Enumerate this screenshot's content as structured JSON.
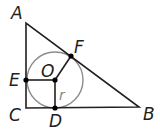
{
  "diagram": {
    "colors": {
      "line": "#231f20",
      "circle": "#8c8c8c",
      "point": "#000000",
      "radius_label": "#888888"
    },
    "points": {
      "A": {
        "label": "A",
        "x": 26,
        "y": 23
      },
      "B": {
        "label": "B",
        "x": 139,
        "y": 107
      },
      "C": {
        "label": "C",
        "x": 26,
        "y": 108
      },
      "D": {
        "label": "D",
        "x": 55,
        "y": 108
      },
      "E": {
        "label": "E",
        "x": 26,
        "y": 80
      },
      "F": {
        "label": "F",
        "x": 71,
        "y": 56
      },
      "O": {
        "label": "O",
        "x": 55,
        "y": 80
      }
    },
    "circle": {
      "center": "O",
      "radius": 28
    },
    "radius_label": "r",
    "segments": [
      "AB",
      "BC",
      "CA",
      "OE",
      "OD",
      "OF"
    ]
  }
}
